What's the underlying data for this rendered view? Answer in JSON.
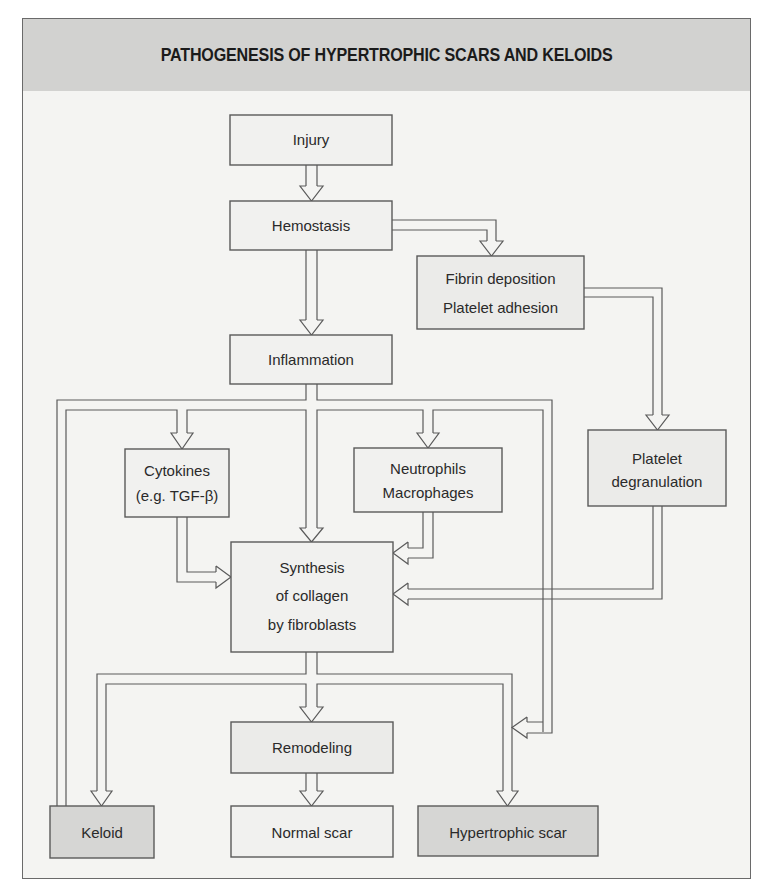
{
  "title": "PATHOGENESIS OF HYPERTROPHIC SCARS AND KELOIDS",
  "colors": {
    "frame_border": "#6a6a6a",
    "header_fill": "#d2d2d0",
    "background": "#f4f4f2",
    "box_border": "#5a5a5a",
    "outcome_fill_dark": "#d6d6d4",
    "box_fill_light": "#f1f1ef"
  },
  "nodes": {
    "injury": {
      "lines": [
        "Injury"
      ]
    },
    "hemostasis": {
      "lines": [
        "Hemostasis"
      ]
    },
    "fibrin": {
      "lines": [
        "Fibrin deposition",
        "Platelet adhesion"
      ]
    },
    "inflammation": {
      "lines": [
        "Inflammation"
      ]
    },
    "cytokines": {
      "lines": [
        "Cytokines",
        "(e.g. TGF-β)"
      ]
    },
    "neutrophils": {
      "lines": [
        "Neutrophils",
        "Macrophages"
      ]
    },
    "platelet_degranulation": {
      "lines": [
        "Platelet",
        "degranulation"
      ]
    },
    "synthesis": {
      "lines": [
        "Synthesis",
        "of collagen",
        "by fibroblasts"
      ]
    },
    "remodeling": {
      "lines": [
        "Remodeling"
      ]
    },
    "keloid": {
      "lines": [
        "Keloid"
      ]
    },
    "normal_scar": {
      "lines": [
        "Normal scar"
      ]
    },
    "hypertrophic_scar": {
      "lines": [
        "Hypertrophic scar"
      ]
    }
  },
  "edges": [
    [
      "injury",
      "hemostasis"
    ],
    [
      "hemostasis",
      "inflammation"
    ],
    [
      "hemostasis",
      "fibrin"
    ],
    [
      "fibrin",
      "platelet_degranulation"
    ],
    [
      "inflammation",
      "cytokines"
    ],
    [
      "inflammation",
      "synthesis"
    ],
    [
      "inflammation",
      "neutrophils"
    ],
    [
      "inflammation",
      "keloid"
    ],
    [
      "inflammation",
      "hypertrophic_scar"
    ],
    [
      "cytokines",
      "synthesis"
    ],
    [
      "neutrophils",
      "synthesis"
    ],
    [
      "platelet_degranulation",
      "synthesis"
    ],
    [
      "synthesis",
      "remodeling"
    ],
    [
      "synthesis",
      "keloid"
    ],
    [
      "synthesis",
      "hypertrophic_scar"
    ],
    [
      "remodeling",
      "normal_scar"
    ]
  ]
}
